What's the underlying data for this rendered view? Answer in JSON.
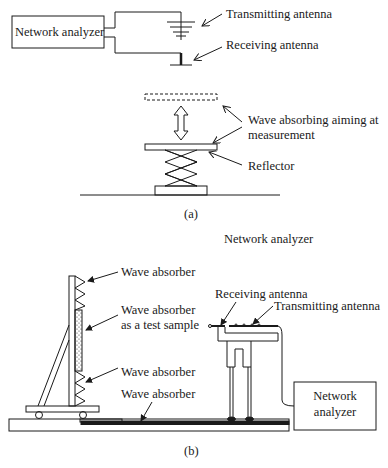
{
  "figure_a": {
    "caption": "(a)",
    "network_analyzer_label": "Network analyzer",
    "transmitting_antenna_label": "Transmitting antenna",
    "receiving_antenna_label": "Receiving antenna",
    "wave_absorbing_label_line1": "Wave absorbing aiming at",
    "wave_absorbing_label_line2": "measurement",
    "reflector_label": "Reflector"
  },
  "figure_b": {
    "caption": "(b)",
    "top_title": "Network analyzer",
    "wave_absorber_top_label": "Wave absorber",
    "test_sample_label_line1": "Wave absorber",
    "test_sample_label_line2": "as a test sample",
    "wave_absorber_bottom_label": "Wave absorber",
    "wave_absorber_floor_label": "Wave absorber",
    "receiving_antenna_label": "Receiving antenna",
    "transmitting_antenna_label": "Transmitting antenna",
    "network_analyzer_box_line1": "Network",
    "network_analyzer_box_line2": "analyzer"
  }
}
